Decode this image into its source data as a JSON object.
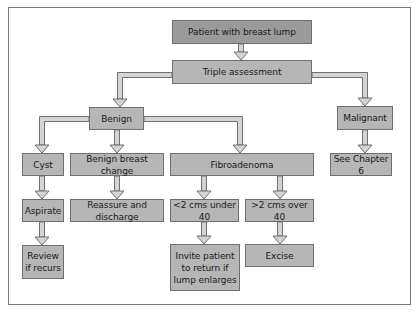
{
  "diagram": {
    "type": "flowchart",
    "nodes": {
      "root": "Patient with breast lump",
      "triple": "Triple assessment",
      "benign": "Benign",
      "malignant": "Malignant",
      "cyst": "Cyst",
      "bbc": "Benign breast change",
      "fibro": "Fibroadenoma",
      "chapter": "See Chapter 6",
      "aspirate": "Aspirate",
      "reassure": "Reassure and discharge",
      "under40": "<2 cms under 40",
      "over40": ">2 cms over 40",
      "review": "Review\nif recurs",
      "invite": "Invite patient\nto return if\nlump enlarges",
      "excise": "Excise"
    },
    "edges": [
      [
        "root",
        "triple"
      ],
      [
        "triple",
        "benign"
      ],
      [
        "triple",
        "malignant"
      ],
      [
        "benign",
        "cyst"
      ],
      [
        "benign",
        "bbc"
      ],
      [
        "benign",
        "fibro"
      ],
      [
        "malignant",
        "chapter"
      ],
      [
        "cyst",
        "aspirate"
      ],
      [
        "bbc",
        "reassure"
      ],
      [
        "fibro",
        "under40"
      ],
      [
        "fibro",
        "over40"
      ],
      [
        "aspirate",
        "review"
      ],
      [
        "under40",
        "invite"
      ],
      [
        "over40",
        "excise"
      ]
    ],
    "colors": {
      "root_fill": "#9a9a9a",
      "node_fill": "#b6b6b6",
      "border": "#6f6f6f",
      "arrow_fill": "#d4d4d4",
      "arrow_stroke": "#707070"
    }
  }
}
